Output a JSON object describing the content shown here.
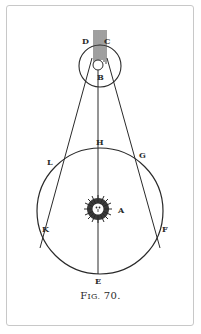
{
  "figure": {
    "caption_prefix": "F",
    "caption_smallcaps": "IG.",
    "caption_number": " 70."
  },
  "labels": {
    "D": "D",
    "C": "C",
    "B": "B",
    "H": "H",
    "G": "G",
    "L": "L",
    "K": "K",
    "F": "F",
    "A": "A",
    "E": "E"
  },
  "colors": {
    "ink": "#2a2a2a",
    "frame": "#c8c8c8",
    "background": "#ffffff"
  }
}
